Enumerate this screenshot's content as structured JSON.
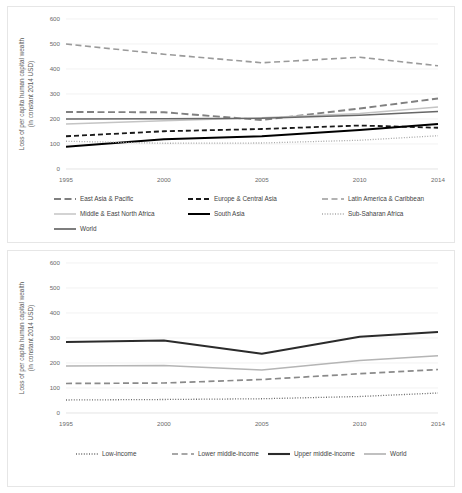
{
  "figure": {
    "panels": [
      "top",
      "bottom"
    ]
  },
  "chart_data": [
    {
      "id": "top",
      "type": "line",
      "title": "",
      "xlabel": "",
      "ylabel": "Loss of per capita human capital wealth",
      "ylabel_line2": "(in constant 2014 USD)",
      "x": [
        1995,
        2000,
        2005,
        2010,
        2014
      ],
      "tick_labels_x": [
        "1995",
        "2000",
        "2005",
        "2010",
        "2014"
      ],
      "tick_labels_y": [
        "0",
        "100",
        "200",
        "300",
        "400",
        "500",
        "600"
      ],
      "ylim": [
        0,
        600
      ],
      "xlim": [
        1995,
        2014
      ],
      "yticks": [
        0,
        100,
        200,
        300,
        400,
        500,
        600
      ],
      "grid": true,
      "legend_position": "bottom",
      "series": [
        {
          "name": "East Asia & Pacific",
          "values": [
            228,
            227,
            196,
            242,
            282
          ],
          "color": "#808080",
          "width": 1.9,
          "dash": "7,3.5"
        },
        {
          "name": "Europe & Central Asia",
          "values": [
            131,
            151,
            160,
            174,
            165
          ],
          "color": "#1a1a1a",
          "width": 1.8,
          "dash": "5,3"
        },
        {
          "name": "Latin America & Caribbean",
          "values": [
            500,
            459,
            425,
            447,
            413
          ],
          "color": "#9a9a9a",
          "width": 1.6,
          "dash": "6,3.5"
        },
        {
          "name": "Middle & East North Africa",
          "values": [
            180,
            193,
            205,
            222,
            248
          ],
          "color": "#c4c4c4",
          "width": 1.5,
          "dash": "none"
        },
        {
          "name": "South Asia",
          "values": [
            89,
            119,
            131,
            156,
            180
          ],
          "color": "#000000",
          "width": 2.0,
          "dash": "none"
        },
        {
          "name": "Sub-Saharan Africa",
          "values": [
            111,
            103,
            104,
            115,
            133
          ],
          "color": "#a8a8a8",
          "width": 1.3,
          "dash": "1,1.6"
        },
        {
          "name": "World",
          "values": [
            200,
            201,
            203,
            215,
            230
          ],
          "color": "#676767",
          "width": 1.7,
          "dash": "none"
        }
      ]
    },
    {
      "id": "bottom",
      "type": "line",
      "title": "",
      "xlabel": "",
      "ylabel": "Loss of per capita human capital wealth",
      "ylabel_line2": "(in constant 2014 USD)",
      "x": [
        1995,
        2000,
        2005,
        2010,
        2014
      ],
      "tick_labels_x": [
        "1995",
        "2000",
        "2005",
        "2010",
        "2014"
      ],
      "tick_labels_y": [
        "0",
        "100",
        "200",
        "300",
        "400",
        "500",
        "600"
      ],
      "ylim": [
        0,
        600
      ],
      "xlim": [
        1995,
        2014
      ],
      "yticks": [
        0,
        100,
        200,
        300,
        400,
        500,
        600
      ],
      "grid": true,
      "legend_position": "bottom",
      "series": [
        {
          "name": "Low-income",
          "values": [
            52,
            54,
            57,
            66,
            80
          ],
          "color": "#6b6b6b",
          "width": 1.3,
          "dash": "1,1.6"
        },
        {
          "name": "Lower middle-income",
          "values": [
            118,
            120,
            134,
            157,
            174
          ],
          "color": "#8a8a8a",
          "width": 1.7,
          "dash": "6,3.5"
        },
        {
          "name": "Upper middle-income",
          "values": [
            284,
            290,
            237,
            305,
            324
          ],
          "color": "#2b2b2b",
          "width": 2.1,
          "dash": "none"
        },
        {
          "name": "World",
          "values": [
            188,
            190,
            172,
            210,
            229
          ],
          "color": "#b5b5b5",
          "width": 1.7,
          "dash": "none"
        }
      ]
    }
  ]
}
